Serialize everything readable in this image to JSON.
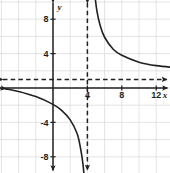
{
  "figure": {
    "kind": "coordinate-grid-graph",
    "background_color": "#ffffff",
    "grid_color": "#d8d8d8",
    "axis_color": "#231f20",
    "curve_color": "#231f20",
    "asymptote_color": "#231f20"
  },
  "chart_data": {
    "type": "line",
    "title": "",
    "subtitle": "",
    "xlabel": "x",
    "ylabel": "y",
    "xlim": [
      -6,
      19
    ],
    "ylim": [
      -15,
      14
    ],
    "grid": true,
    "grid_step": 2,
    "legend": null,
    "x_tick_labels": [
      "4",
      "8",
      "12",
      "16"
    ],
    "x_tick_values": [
      4,
      8,
      12,
      16
    ],
    "y_tick_labels": [
      "12",
      "8",
      "4",
      "-4",
      "-8",
      "-12"
    ],
    "y_tick_values": [
      12,
      8,
      4,
      -4,
      -8,
      -12
    ],
    "annotations": [
      {
        "name": "vertical-asymptote",
        "type": "dashed-line",
        "orientation": "vertical",
        "value": 4
      },
      {
        "name": "horizontal-asymptote",
        "type": "dashed-line",
        "orientation": "horizontal",
        "value": 1
      }
    ],
    "series": [
      {
        "name": "hyperbola-upper-right-branch",
        "arrowheads": [
          "start",
          "end"
        ],
        "points": [
          {
            "x": 4.6,
            "y": 14.0
          },
          {
            "x": 4.8,
            "y": 11.5
          },
          {
            "x": 5.1,
            "y": 9.0
          },
          {
            "x": 5.5,
            "y": 7.2
          },
          {
            "x": 6.0,
            "y": 5.9
          },
          {
            "x": 7.0,
            "y": 4.5
          },
          {
            "x": 8.0,
            "y": 3.8
          },
          {
            "x": 10.0,
            "y": 3.0
          },
          {
            "x": 12.0,
            "y": 2.6
          },
          {
            "x": 15.0,
            "y": 2.3
          },
          {
            "x": 18.0,
            "y": 2.1
          }
        ]
      },
      {
        "name": "hyperbola-lower-left-branch",
        "arrowheads": [
          "start",
          "end"
        ],
        "points": [
          {
            "x": -5.5,
            "y": -0.1
          },
          {
            "x": -4.0,
            "y": -0.4
          },
          {
            "x": -2.0,
            "y": -1.0
          },
          {
            "x": 0.0,
            "y": -1.9
          },
          {
            "x": 1.0,
            "y": -2.6
          },
          {
            "x": 2.0,
            "y": -3.7
          },
          {
            "x": 2.8,
            "y": -5.3
          },
          {
            "x": 3.2,
            "y": -7.0
          },
          {
            "x": 3.5,
            "y": -9.0
          },
          {
            "x": 3.7,
            "y": -11.5
          },
          {
            "x": 3.8,
            "y": -14.2
          }
        ]
      }
    ]
  }
}
